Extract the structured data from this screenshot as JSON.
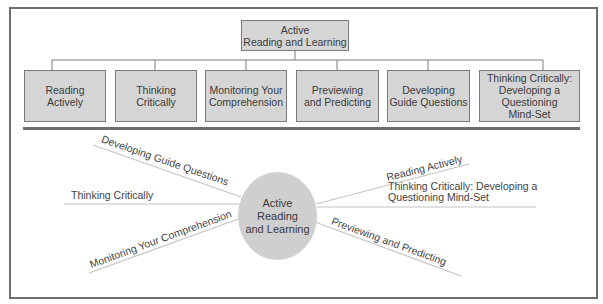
{
  "hierarchy": {
    "root": "Active\nReading and Learning",
    "children": [
      "Reading\nActively",
      "Thinking\nCritically",
      "Monitoring Your\nComprehension",
      "Previewing\nand Predicting",
      "Developing\nGuide Questions",
      "Thinking Critically:\nDeveloping a\nQuestioning\nMind-Set"
    ]
  },
  "web": {
    "center": "Active\nReading\nand Learning",
    "spokes": {
      "developing_guide_questions": "Developing Guide Questions",
      "thinking_critically": "Thinking Critically",
      "monitoring": "Monitoring Your Comprehension",
      "reading_actively": "Reading Actively",
      "thinking_critically_mindset": "Thinking Critically: Developing a\nQuestioning Mind-Set",
      "previewing": "Previewing and Predicting"
    }
  },
  "colors": {
    "box_fill": "#d5d5d5",
    "border": "#6e6e6e",
    "line": "#bdbdbd"
  }
}
